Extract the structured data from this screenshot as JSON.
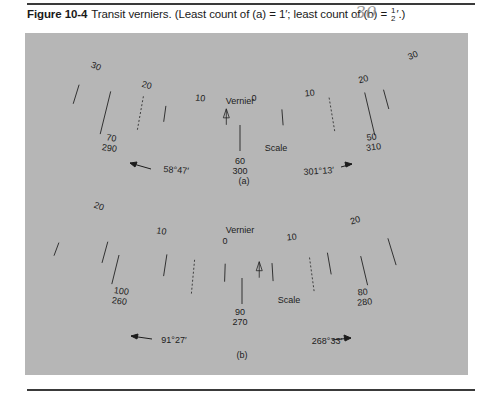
{
  "caption": {
    "figure_label": "Figure 10-4",
    "text_before": "Transit verniers. (Least count of (a) = 1′; least count of (b) = ",
    "frac_num": "1",
    "frac_den": "2",
    "text_after": "′.)"
  },
  "margin_note": "30",
  "colors": {
    "panel": "#b6b6b6",
    "ink": "#1c1c1c",
    "rule": "#3a3a3a"
  },
  "vernier_a": {
    "sublabel": "(a)",
    "vernier_label": "Vernier",
    "scale_label": "Scale",
    "vernier_numbers_left": [
      "30",
      "20",
      "10"
    ],
    "vernier_zero": "0",
    "vernier_numbers_right": [
      "10",
      "20",
      "30"
    ],
    "scale_labels": [
      {
        "top": "70",
        "bottom": "290"
      },
      {
        "top": "60",
        "bottom": "300"
      },
      {
        "top": "50",
        "bottom": "310"
      }
    ],
    "reading_left": "58°47′",
    "reading_right": "301°13′",
    "least_count": "1′"
  },
  "vernier_b": {
    "sublabel": "(b)",
    "vernier_label": "Vernier",
    "scale_label": "Scale",
    "vernier_numbers_left": [
      "20",
      "10"
    ],
    "vernier_zero": "0",
    "vernier_numbers_right": [
      "10",
      "20"
    ],
    "scale_labels": [
      {
        "top": "100",
        "bottom": "260"
      },
      {
        "top": "90",
        "bottom": "270"
      },
      {
        "top": "80",
        "bottom": "280"
      }
    ],
    "reading_left": "91°27′",
    "reading_right": "268°33′",
    "least_count": "½′"
  }
}
